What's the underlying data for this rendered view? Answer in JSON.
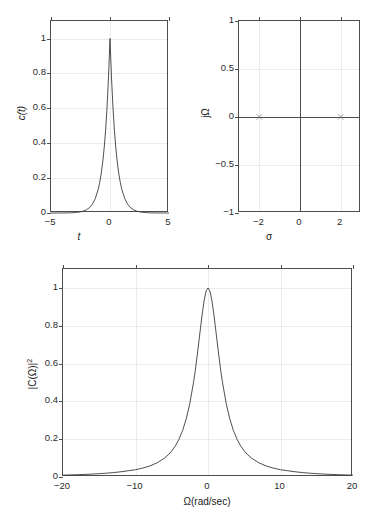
{
  "figure": {
    "background": "#ffffff",
    "axis_color": "#4d4d4d",
    "grid_color": "#ececec",
    "curve_color": "#3b3b3b"
  },
  "chart_data": [
    {
      "id": "time-domain",
      "type": "line",
      "title": "",
      "xlabel": "t",
      "ylabel": "c(t)",
      "xlim": [
        -5,
        5
      ],
      "ylim": [
        0,
        1.1
      ],
      "xticks": [
        -5,
        0,
        5
      ],
      "xticklabels": [
        "−5",
        "0",
        "5"
      ],
      "yticks": [
        0,
        0.2,
        0.4,
        0.6,
        0.8,
        1
      ],
      "yticklabels": [
        "0",
        "0.2",
        "0.4",
        "0.6",
        "0.8",
        "1"
      ],
      "grid": true,
      "legend": "none",
      "annotation": "Two-sided exponential c(t) = e^(-a|t|), a = 2; peak value 1 at t = 0",
      "x": [
        -5,
        -4.75,
        -4.5,
        -4.25,
        -4,
        -3.75,
        -3.5,
        -3.25,
        -3,
        -2.75,
        -2.5,
        -2.25,
        -2,
        -1.75,
        -1.5,
        -1.25,
        -1,
        -0.875,
        -0.75,
        -0.625,
        -0.5,
        -0.375,
        -0.25,
        -0.125,
        0,
        0.125,
        0.25,
        0.375,
        0.5,
        0.625,
        0.75,
        0.875,
        1,
        1.25,
        1.5,
        1.75,
        2,
        2.25,
        2.5,
        2.75,
        3,
        3.25,
        3.5,
        3.75,
        4,
        4.25,
        4.5,
        4.75,
        5
      ],
      "values": [
        5e-05,
        7e-05,
        0.00012,
        0.0002,
        0.00034,
        0.00055,
        0.00091,
        0.0015,
        0.00248,
        0.00409,
        0.00674,
        0.01111,
        0.01832,
        0.0302,
        0.04979,
        0.08208,
        0.13534,
        0.17377,
        0.22313,
        0.2865,
        0.36788,
        0.47237,
        0.60653,
        0.7788,
        1,
        0.7788,
        0.60653,
        0.47237,
        0.36788,
        0.2865,
        0.22313,
        0.17377,
        0.13534,
        0.08208,
        0.04979,
        0.0302,
        0.01832,
        0.01111,
        0.00674,
        0.00409,
        0.00248,
        0.0015,
        0.00091,
        0.00055,
        0.00034,
        0.0002,
        0.00012,
        7e-05,
        5e-05
      ]
    },
    {
      "id": "s-plane",
      "type": "scatter",
      "title": "",
      "xlabel": "σ",
      "ylabel": "jΩ",
      "xlim": [
        -3,
        3
      ],
      "ylim": [
        -1,
        1
      ],
      "xticks": [
        -2,
        0,
        2
      ],
      "xticklabels": [
        "−2",
        "0",
        "2"
      ],
      "yticks": [
        -1,
        -0.5,
        0,
        0.5,
        1
      ],
      "yticklabels": [
        "−1",
        "−0.5",
        "0",
        "0.5",
        "1"
      ],
      "grid": true,
      "legend": "none",
      "annotation": "s-plane with real axis and imaginary axis drawn; poles on the real axis at σ = ±2",
      "poles": [
        {
          "sigma": -2,
          "omega": 0
        },
        {
          "sigma": 2,
          "omega": 0
        }
      ],
      "zeros": []
    },
    {
      "id": "energy-spectral-density",
      "type": "line",
      "title": "",
      "xlabel": "Ω(rad/sec)",
      "ylabel": "|C(Ω)|²",
      "xlim": [
        -20,
        20
      ],
      "ylim": [
        0,
        1.1
      ],
      "xticks": [
        -20,
        -10,
        0,
        10,
        20
      ],
      "xticklabels": [
        "−20",
        "−10",
        "0",
        "10",
        "20"
      ],
      "yticks": [
        0,
        0.2,
        0.4,
        0.6,
        0.8,
        1
      ],
      "yticklabels": [
        "0",
        "0.2",
        "0.4",
        "0.6",
        "0.8",
        "1"
      ],
      "grid": true,
      "legend": "none",
      "annotation": "Lorentzian-squared magnitude response peaking at 1 for Ω = 0",
      "x": [
        -20,
        -19,
        -18,
        -17,
        -16,
        -15,
        -14,
        -13,
        -12,
        -11,
        -10,
        -9,
        -8,
        -7,
        -6,
        -5.5,
        -5,
        -4.5,
        -4,
        -3.5,
        -3,
        -2.5,
        -2,
        -1.75,
        -1.5,
        -1.25,
        -1,
        -0.75,
        -0.5,
        -0.25,
        0,
        0.25,
        0.5,
        0.75,
        1,
        1.25,
        1.5,
        1.75,
        2,
        2.5,
        3,
        3.5,
        4,
        4.5,
        5,
        5.5,
        6,
        7,
        8,
        9,
        10,
        11,
        12,
        13,
        14,
        15,
        16,
        17,
        18,
        19,
        20
      ],
      "values": [
        0.0099,
        0.01094,
        0.01217,
        0.01363,
        0.01538,
        0.01754,
        0.0202,
        0.02358,
        0.02778,
        0.03306,
        0.03846,
        0.04706,
        0.05882,
        0.07547,
        0.1,
        0.11696,
        0.13793,
        0.16456,
        0.2,
        0.24615,
        0.30769,
        0.39024,
        0.5,
        0.56338,
        0.64,
        0.7191,
        0.8,
        0.87671,
        0.94118,
        0.98462,
        1.0,
        0.98462,
        0.94118,
        0.87671,
        0.8,
        0.7191,
        0.64,
        0.56338,
        0.5,
        0.39024,
        0.30769,
        0.24615,
        0.2,
        0.16456,
        0.13793,
        0.11696,
        0.1,
        0.07547,
        0.05882,
        0.04706,
        0.03846,
        0.03306,
        0.02778,
        0.02358,
        0.0202,
        0.01754,
        0.01538,
        0.01363,
        0.01217,
        0.01094,
        0.0099
      ]
    }
  ]
}
